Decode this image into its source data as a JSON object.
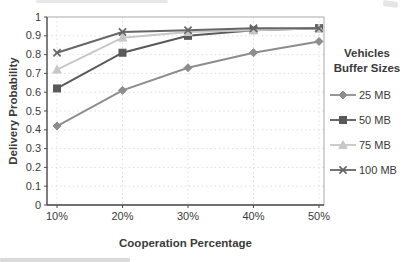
{
  "chart_data": {
    "type": "line",
    "title": "",
    "xlabel": "Cooperation Percentage",
    "ylabel": "Delivery Probability",
    "categories": [
      "10%",
      "20%",
      "30%",
      "40%",
      "50%"
    ],
    "y_ticks": [
      "0",
      "0.1",
      "0.2",
      "0.3",
      "0.4",
      "0.5",
      "0.6",
      "0.7",
      "0.8",
      "0.9",
      "1"
    ],
    "ylim": [
      0,
      1
    ],
    "grid": "dotted-both-axes",
    "plot_frame": true,
    "legend_position": "right",
    "legend_title": [
      "Vehicles",
      "Buffer Sizes"
    ],
    "axis_color": "#4f4f4f",
    "grid_color": "#dedede",
    "text_color": "#3a3a3a",
    "series": [
      {
        "name": "25 MB",
        "marker": "diamond",
        "color": "#8d8d90",
        "values": [
          0.42,
          0.61,
          0.73,
          0.81,
          0.87
        ]
      },
      {
        "name": "50 MB",
        "marker": "square",
        "color": "#59595b",
        "values": [
          0.62,
          0.81,
          0.9,
          0.93,
          0.94
        ]
      },
      {
        "name": "75 MB",
        "marker": "triangle",
        "color": "#c7c7c7",
        "values": [
          0.72,
          0.89,
          0.92,
          0.93,
          0.94
        ]
      },
      {
        "name": "100 MB",
        "marker": "x",
        "color": "#666669",
        "values": [
          0.81,
          0.92,
          0.93,
          0.94,
          0.94
        ]
      }
    ]
  }
}
